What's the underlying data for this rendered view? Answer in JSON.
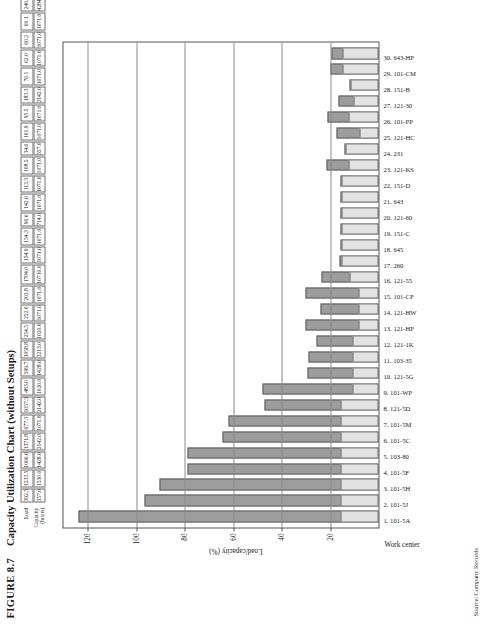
{
  "figure": {
    "number": "FIGURE 8.7",
    "title": "Capacity Utilization Chart (without Setups)",
    "source": "Source: Company Records"
  },
  "table": {
    "row_labels": [
      "Load",
      "Capacity\n(hours)"
    ],
    "load_label": "Load",
    "capacity_label_line1": "Capacity",
    "capacity_label_line2": "(hours)"
  },
  "chart_data": {
    "type": "bar",
    "title": "Capacity Utilization Chart (without Setups)",
    "xlabel": "Work center",
    "ylabel": "Load/capacity (%)",
    "ylim": [
      0,
      130
    ],
    "yticks": [
      20,
      40,
      60,
      80,
      100,
      120
    ],
    "ytick_labels": [
      "20",
      "40",
      "60",
      "80",
      "100",
      "120"
    ],
    "grid": true,
    "legend": "none",
    "orientation": "rotated-90-landscape-on-portrait-page",
    "bar_colors": {
      "upper": "#9d9d9d",
      "lower": "#e2e2e2",
      "outline": "#5c5c5c"
    },
    "categories": [
      "1.  101-5A",
      "2.  101-5J",
      "3.  101-5H",
      "4.  101-5F",
      "5.  103-80",
      "6.  101-5C",
      "7.  101-5M",
      "8.  121-5D",
      "9.  101-WP",
      "10.  121-5G",
      "11.  103-35",
      "12.  121-1K",
      "13.  121-HP",
      "14.  121-HW",
      "15.  101-CP",
      "16.  121-55",
      "17.  260",
      "18.  645",
      "19.  151-C",
      "20.  121-60",
      "21.  643",
      "22.  151-D",
      "23.  121-KS",
      "24.  231",
      "25.  121-HC",
      "26.  101-PP",
      "27.  121-30",
      "28.  151-B",
      "29.  101-CM",
      "30.  643-HP"
    ],
    "work_centers": [
      "101-5A",
      "101-5J",
      "101-5H",
      "101-5F",
      "103-80",
      "101-5C",
      "101-5M",
      "121-5D",
      "101-WP",
      "121-5G",
      "103-35",
      "121-1K",
      "121-HP",
      "121-HW",
      "101-CP",
      "121-55",
      "260",
      "645",
      "151-C",
      "121-60",
      "643",
      "151-D",
      "121-KS",
      "231",
      "121-HC",
      "101-PP",
      "121-30",
      "151-B",
      "101-CM",
      "643-HP"
    ],
    "load": [
      392.5,
      1233.5,
      1066.6,
      1371.8,
      677.3,
      1057.3,
      483.0,
      599.7,
      1058.8,
      254.5,
      252.0,
      203.8,
      1704.0,
      154.9,
      154.3,
      96.6,
      142.6,
      113.3,
      108.5,
      34.6,
      101.9,
      95.5,
      183.3,
      76.1,
      62.0,
      60.2,
      60.1,
      240.1,
      108.6,
      48.0
    ],
    "capacity": [
      357.0,
      1530.0,
      1428.0,
      2142.0,
      1071.0,
      2142.0,
      1020.0,
      1428.0,
      3213.0,
      1020.0,
      1071.0,
      1071.0,
      10710.0,
      1071.0,
      1071.0,
      714.0,
      1071.0,
      1071.0,
      1071.0,
      357.0,
      1071.0,
      1071.0,
      2142.0,
      1071.0,
      1071.0,
      1071.0,
      1071.0,
      4284.0,
      2142.0,
      1071.0
    ],
    "load_display": [
      "392.5",
      "1233.5",
      "1066.6",
      "1371.8",
      "677.3",
      "1057.3",
      "483.0",
      "599.7",
      "1058.8",
      "254.5",
      "252.0",
      "203.8",
      "1704.0",
      "154.9",
      "154.3",
      "96.6",
      "142.6",
      "113.3",
      "108.5",
      "34.6",
      "101.9",
      "95.5",
      "183.3",
      "76.1",
      "62.0",
      "60.2",
      "60.1",
      "240.1",
      "108.6",
      "48.0"
    ],
    "capacity_display": [
      "357.0",
      "1530.0",
      "1428.0",
      "2142.0",
      "1071.0",
      "2142.0",
      "1020.0",
      "1428.0",
      "3213.0",
      "1020.0",
      "1071.0",
      "1071.0",
      "10710.0",
      "1071.0",
      "1071.0",
      "714.0",
      "1071.0",
      "1071.0",
      "1071.0",
      "357.0",
      "1071.0",
      "1071.0",
      "2142.0",
      "1071.0",
      "1071.0",
      "1071.0",
      "1071.0",
      "4284.0",
      "2142.0",
      "1071.0"
    ],
    "values": [
      124.0,
      96.5,
      90.5,
      79.0,
      78.8,
      64.5,
      62.0,
      47.0,
      48.0,
      29.5,
      29.0,
      25.5,
      30.0,
      24.0,
      30.0,
      23.5,
      16.0,
      15.5,
      15.5,
      15.5,
      15.5,
      15.5,
      21.5,
      14.0,
      17.5,
      21.0,
      16.5,
      12.0,
      20.0,
      19.5
    ],
    "lower_segment": [
      15.5,
      15.5,
      15.5,
      15.5,
      15.5,
      15.5,
      15.5,
      15.5,
      10.5,
      10.5,
      10.5,
      10.5,
      8.0,
      8.0,
      8.0,
      12.0,
      15.5,
      15.5,
      15.5,
      15.5,
      15.5,
      15.5,
      12.5,
      14.0,
      8.0,
      12.5,
      10.5,
      12.0,
      15.0,
      15.0
    ]
  }
}
